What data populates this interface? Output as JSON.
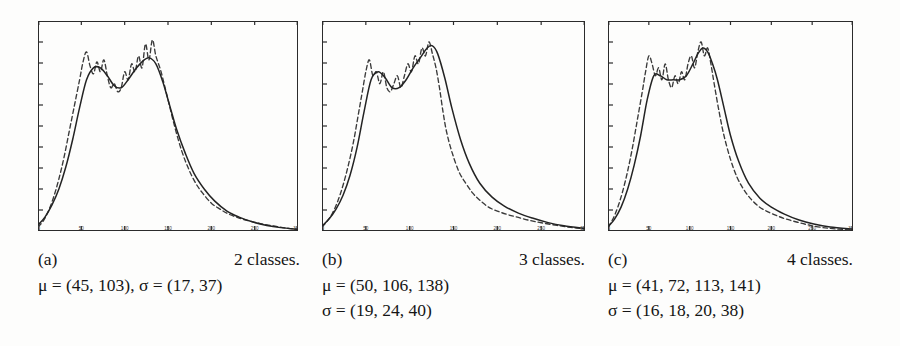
{
  "figure": {
    "background": "#fdfdfc",
    "ink_color": "#232323"
  },
  "panels": [
    {
      "id": "a",
      "label": "(a)",
      "classes_text": "2 classes.",
      "mu_text": "μ = (45, 103), σ = (17, 37)",
      "sigma_text": "",
      "stats_single_line": true,
      "mu_values": [
        45,
        103
      ],
      "sigma_values": [
        17,
        37
      ],
      "n_classes": 2
    },
    {
      "id": "b",
      "label": "(b)",
      "classes_text": "3 classes.",
      "mu_text": "μ = (50, 106, 138)",
      "sigma_text": "σ = (19, 24, 40)",
      "stats_single_line": false,
      "mu_values": [
        50,
        106,
        138
      ],
      "sigma_values": [
        19,
        24,
        40
      ],
      "n_classes": 3
    },
    {
      "id": "c",
      "label": "(c)",
      "classes_text": "4 classes.",
      "mu_text": "μ = (41, 72, 113, 141)",
      "sigma_text": "σ = (16, 18, 20, 38)",
      "stats_single_line": false,
      "mu_values": [
        41,
        72,
        113,
        141
      ],
      "sigma_values": [
        16,
        18,
        20,
        38
      ],
      "n_classes": 4
    }
  ],
  "chart_data": [
    {
      "type": "line",
      "title": "",
      "panel": "a",
      "xlabel": "",
      "ylabel": "",
      "xlim": [
        0,
        300
      ],
      "ylim": [
        0,
        1
      ],
      "grid": false,
      "legend": "none",
      "xticks": [
        0,
        50,
        100,
        150,
        200,
        250,
        300
      ],
      "xticklabels": [
        "0",
        "50",
        "100",
        "150",
        "200",
        "250",
        "300"
      ],
      "yticks_count": 9,
      "yticklabels": [],
      "series": [
        {
          "name": "histogram",
          "style": "dashed",
          "x": [
            0,
            6,
            12,
            18,
            24,
            30,
            36,
            42,
            48,
            52,
            56,
            60,
            64,
            68,
            72,
            76,
            80,
            84,
            88,
            92,
            96,
            100,
            104,
            108,
            112,
            116,
            120,
            124,
            128,
            132,
            136,
            142,
            150,
            158,
            166,
            174,
            182,
            190,
            200,
            210,
            220,
            232,
            244,
            258,
            272,
            286,
            300
          ],
          "y": [
            0.02,
            0.05,
            0.1,
            0.17,
            0.26,
            0.37,
            0.5,
            0.63,
            0.76,
            0.85,
            0.9,
            0.83,
            0.79,
            0.85,
            0.8,
            0.86,
            0.78,
            0.72,
            0.74,
            0.7,
            0.72,
            0.8,
            0.76,
            0.84,
            0.8,
            0.88,
            0.82,
            0.94,
            0.86,
            0.96,
            0.88,
            0.8,
            0.66,
            0.52,
            0.4,
            0.31,
            0.24,
            0.19,
            0.14,
            0.11,
            0.085,
            0.065,
            0.05,
            0.036,
            0.025,
            0.015,
            0.008
          ]
        },
        {
          "name": "mixture-fit",
          "style": "solid",
          "x": [
            0,
            8,
            16,
            24,
            32,
            40,
            48,
            56,
            64,
            72,
            80,
            88,
            96,
            104,
            112,
            120,
            128,
            136,
            144,
            152,
            160,
            170,
            180,
            192,
            204,
            218,
            232,
            248,
            264,
            280,
            300
          ],
          "y": [
            0.03,
            0.07,
            0.13,
            0.21,
            0.32,
            0.46,
            0.62,
            0.76,
            0.82,
            0.82,
            0.78,
            0.73,
            0.72,
            0.76,
            0.81,
            0.85,
            0.87,
            0.84,
            0.75,
            0.63,
            0.51,
            0.39,
            0.29,
            0.21,
            0.15,
            0.1,
            0.07,
            0.045,
            0.028,
            0.017,
            0.008
          ]
        }
      ]
    },
    {
      "type": "line",
      "title": "",
      "panel": "b",
      "xlabel": "",
      "ylabel": "",
      "xlim": [
        0,
        300
      ],
      "ylim": [
        0,
        1
      ],
      "grid": false,
      "legend": "none",
      "xticks": [
        0,
        50,
        100,
        150,
        200,
        250,
        300
      ],
      "xticklabels": [
        "0",
        "50",
        "100",
        "150",
        "200",
        "250",
        "300"
      ],
      "yticks_count": 9,
      "yticklabels": [],
      "series": [
        {
          "name": "histogram",
          "style": "dashed",
          "x": [
            0,
            6,
            12,
            18,
            24,
            30,
            36,
            42,
            46,
            50,
            54,
            58,
            62,
            66,
            70,
            74,
            78,
            82,
            86,
            90,
            94,
            98,
            102,
            106,
            110,
            114,
            118,
            122,
            126,
            130,
            134,
            138,
            142,
            148,
            156,
            164,
            172,
            180,
            190,
            200,
            212,
            224,
            238,
            252,
            268,
            284,
            300
          ],
          "y": [
            0.02,
            0.05,
            0.09,
            0.15,
            0.23,
            0.33,
            0.45,
            0.6,
            0.7,
            0.8,
            0.86,
            0.78,
            0.8,
            0.74,
            0.8,
            0.72,
            0.7,
            0.74,
            0.78,
            0.72,
            0.78,
            0.84,
            0.8,
            0.88,
            0.84,
            0.92,
            0.88,
            0.95,
            0.89,
            0.82,
            0.72,
            0.6,
            0.5,
            0.4,
            0.3,
            0.24,
            0.19,
            0.155,
            0.12,
            0.1,
            0.082,
            0.068,
            0.052,
            0.04,
            0.028,
            0.018,
            0.01
          ]
        },
        {
          "name": "mixture-fit",
          "style": "solid",
          "x": [
            0,
            8,
            16,
            24,
            32,
            40,
            48,
            56,
            64,
            72,
            80,
            88,
            96,
            104,
            112,
            120,
            126,
            132,
            140,
            148,
            158,
            168,
            180,
            194,
            208,
            224,
            240,
            258,
            276,
            300
          ],
          "y": [
            0.025,
            0.06,
            0.11,
            0.18,
            0.28,
            0.42,
            0.6,
            0.76,
            0.8,
            0.77,
            0.72,
            0.72,
            0.76,
            0.82,
            0.87,
            0.92,
            0.93,
            0.89,
            0.77,
            0.62,
            0.46,
            0.34,
            0.24,
            0.17,
            0.125,
            0.09,
            0.065,
            0.042,
            0.026,
            0.012
          ]
        }
      ]
    },
    {
      "type": "line",
      "title": "",
      "panel": "c",
      "xlabel": "",
      "ylabel": "",
      "xlim": [
        0,
        300
      ],
      "ylim": [
        0,
        1
      ],
      "grid": false,
      "legend": "none",
      "xticks": [
        0,
        50,
        100,
        150,
        200,
        250,
        300
      ],
      "xticklabels": [
        "0",
        "50",
        "100",
        "150",
        "200",
        "250",
        "300"
      ],
      "yticks_count": 9,
      "yticklabels": [],
      "series": [
        {
          "name": "histogram",
          "style": "dashed",
          "x": [
            0,
            6,
            12,
            18,
            24,
            30,
            36,
            42,
            46,
            50,
            54,
            58,
            62,
            66,
            70,
            74,
            78,
            82,
            86,
            90,
            94,
            98,
            102,
            106,
            110,
            114,
            118,
            122,
            126,
            130,
            136,
            142,
            150,
            158,
            166,
            174,
            184,
            194,
            206,
            218,
            232,
            246,
            262,
            280,
            300
          ],
          "y": [
            0.02,
            0.06,
            0.12,
            0.2,
            0.3,
            0.42,
            0.56,
            0.7,
            0.8,
            0.88,
            0.84,
            0.78,
            0.82,
            0.76,
            0.84,
            0.76,
            0.72,
            0.78,
            0.74,
            0.8,
            0.76,
            0.84,
            0.88,
            0.82,
            0.9,
            0.95,
            0.88,
            0.92,
            0.84,
            0.74,
            0.6,
            0.48,
            0.36,
            0.27,
            0.21,
            0.165,
            0.125,
            0.1,
            0.078,
            0.06,
            0.044,
            0.03,
            0.018,
            0.01,
            0.005
          ]
        },
        {
          "name": "mixture-fit",
          "style": "solid",
          "x": [
            0,
            8,
            16,
            24,
            32,
            40,
            48,
            56,
            64,
            72,
            80,
            88,
            96,
            104,
            110,
            116,
            122,
            128,
            134,
            142,
            150,
            160,
            172,
            186,
            200,
            216,
            234,
            252,
            272,
            300
          ],
          "y": [
            0.02,
            0.06,
            0.12,
            0.21,
            0.33,
            0.48,
            0.66,
            0.78,
            0.78,
            0.76,
            0.76,
            0.76,
            0.78,
            0.84,
            0.89,
            0.92,
            0.9,
            0.84,
            0.76,
            0.62,
            0.48,
            0.35,
            0.24,
            0.165,
            0.12,
            0.085,
            0.055,
            0.035,
            0.02,
            0.009
          ]
        }
      ]
    }
  ]
}
